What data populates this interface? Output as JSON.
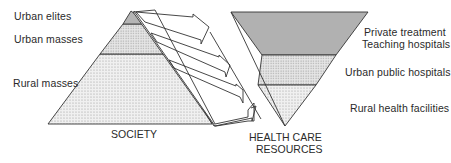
{
  "society": {
    "caption": "SOCIETY",
    "layers": [
      {
        "label": "Urban elites"
      },
      {
        "label": "Urban masses"
      },
      {
        "label": "Rural masses"
      }
    ]
  },
  "health": {
    "caption_line1": "HEALTH CARE",
    "caption_line2": "RESOURCES",
    "layers": [
      {
        "label_line1": "Private treatment",
        "label_line2": "Teaching hospitals"
      },
      {
        "label_line1": "Urban public hospitals"
      },
      {
        "label_line1": "Rural health facilities"
      }
    ]
  },
  "colors": {
    "stroke": "#333333",
    "dark_fill": "#b8b8b8",
    "mid_fill": "#d8d8d8",
    "light_fill": "#e4e4e4"
  }
}
